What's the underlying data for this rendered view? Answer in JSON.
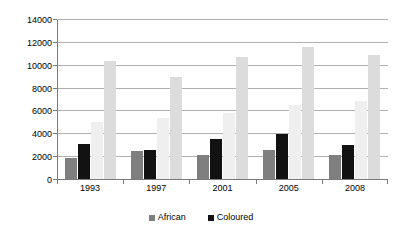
{
  "chart_data": {
    "type": "bar",
    "title": "",
    "subtitle": "",
    "xlabel": "",
    "ylabel": "",
    "categories": [
      "1993",
      "1997",
      "2001",
      "2005",
      "2008"
    ],
    "ylim": [
      0,
      14000
    ],
    "y_ticks": [
      0,
      2000,
      4000,
      6000,
      8000,
      10000,
      12000,
      14000
    ],
    "y_tick_labels": [
      "0",
      "2000",
      "4000",
      "6000",
      "8000",
      "10000",
      "12000",
      "14000"
    ],
    "grid": true,
    "legend_position": "bottom",
    "series": [
      {
        "name": "African",
        "color": "#7f7f7f",
        "in_legend": true,
        "values": [
          1950,
          2550,
          2200,
          2650,
          2150
        ]
      },
      {
        "name": "Coloured",
        "color": "#121212",
        "in_legend": true,
        "values": [
          3150,
          2650,
          3550,
          4050,
          3100
        ]
      },
      {
        "name": "",
        "color": "#efefef",
        "in_legend": false,
        "values": [
          5050,
          5450,
          5900,
          6600,
          6900
        ]
      },
      {
        "name": "",
        "color": "#dcdcdc",
        "in_legend": false,
        "values": [
          10400,
          9050,
          10800,
          11650,
          10900
        ]
      }
    ]
  },
  "legend": {
    "items": [
      {
        "label": "African",
        "color": "#7f7f7f"
      },
      {
        "label": "Coloured",
        "color": "#121212"
      }
    ]
  },
  "colors": {
    "gridline": "#b0b0b0",
    "axis": "#7a7a7a",
    "background": "#ffffff",
    "text": "#000000"
  }
}
